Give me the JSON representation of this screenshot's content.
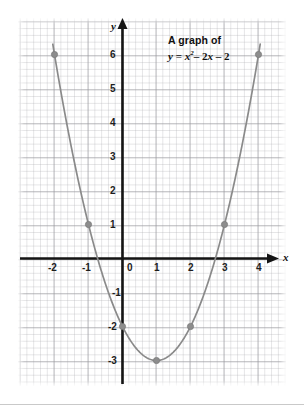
{
  "figure": {
    "caption_line1": "A graph of",
    "caption_line2_prefix": "y",
    "caption_line2_eq": "=",
    "caption_line2_x": "x",
    "caption_line2_exp": "2",
    "caption_line2_minus1": "– 2",
    "caption_line2_x2": "x",
    "caption_line2_minus2": "– 2",
    "x_axis_name": "x",
    "y_axis_name": "y"
  },
  "axes": {
    "x_tick_labels": [
      "-2",
      "-1",
      "0",
      "1",
      "2",
      "3",
      "4"
    ],
    "y_tick_labels": [
      "6",
      "5",
      "4",
      "3",
      "2",
      "1",
      "-1",
      "-2",
      "-3"
    ],
    "origin_label": "0"
  },
  "colors": {
    "curve": "#8a8a8a",
    "point": "#8d8d8d",
    "axis": "#141414",
    "grid_major": "#96969b",
    "grid_minor": "#afafb4",
    "background": "#ffffff"
  },
  "chart_data": {
    "type": "line",
    "equation": "y = x^2 - 2x - 2",
    "xlabel": "x",
    "ylabel": "y",
    "xlim": [
      -2.4,
      4.4
    ],
    "ylim": [
      -3.6,
      6.6
    ],
    "xticks": [
      -2,
      -1,
      0,
      1,
      2,
      3,
      4
    ],
    "yticks": [
      6,
      5,
      4,
      3,
      2,
      1,
      0,
      -1,
      -2,
      -3
    ],
    "grid": true,
    "legend": "none",
    "marked_points": [
      {
        "x": -2,
        "y": 6
      },
      {
        "x": -1,
        "y": 1
      },
      {
        "x": 0,
        "y": -2
      },
      {
        "x": 1,
        "y": -3
      },
      {
        "x": 2,
        "y": -2
      },
      {
        "x": 3,
        "y": 1
      },
      {
        "x": 4,
        "y": 6
      }
    ],
    "series": [
      {
        "name": "y = x^2 - 2x - 2",
        "x": [
          -2,
          -1,
          0,
          1,
          2,
          3,
          4
        ],
        "values": [
          6,
          1,
          -2,
          -3,
          -2,
          1,
          6
        ]
      }
    ],
    "vertex": {
      "x": 1,
      "y": -3
    },
    "y_intercept": -2,
    "x_intercepts": [
      -0.732,
      2.732
    ]
  }
}
